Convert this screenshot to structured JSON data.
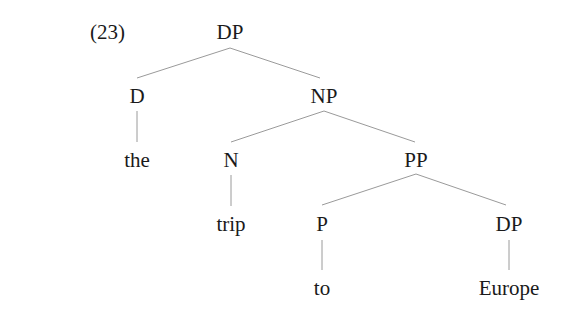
{
  "example_number": "(23)",
  "tree": {
    "nodes": [
      {
        "id": "dp_root",
        "label": "DP",
        "x": 230,
        "y": 32
      },
      {
        "id": "d",
        "label": "D",
        "x": 137,
        "y": 96
      },
      {
        "id": "np",
        "label": "NP",
        "x": 324,
        "y": 96
      },
      {
        "id": "the",
        "label": "the",
        "x": 137,
        "y": 160
      },
      {
        "id": "n",
        "label": "N",
        "x": 231,
        "y": 160
      },
      {
        "id": "pp",
        "label": "PP",
        "x": 416,
        "y": 160
      },
      {
        "id": "trip",
        "label": "trip",
        "x": 231,
        "y": 224
      },
      {
        "id": "p",
        "label": "P",
        "x": 322,
        "y": 224
      },
      {
        "id": "dp_obj",
        "label": "DP",
        "x": 509,
        "y": 224
      },
      {
        "id": "to",
        "label": "to",
        "x": 322,
        "y": 288
      },
      {
        "id": "europe",
        "label": "Europe",
        "x": 509,
        "y": 288
      }
    ],
    "edges": [
      [
        "dp_root",
        "d"
      ],
      [
        "dp_root",
        "np"
      ],
      [
        "d",
        "the"
      ],
      [
        "np",
        "n"
      ],
      [
        "np",
        "pp"
      ],
      [
        "n",
        "trip"
      ],
      [
        "pp",
        "p"
      ],
      [
        "pp",
        "dp_obj"
      ],
      [
        "p",
        "to"
      ],
      [
        "dp_obj",
        "europe"
      ]
    ]
  }
}
